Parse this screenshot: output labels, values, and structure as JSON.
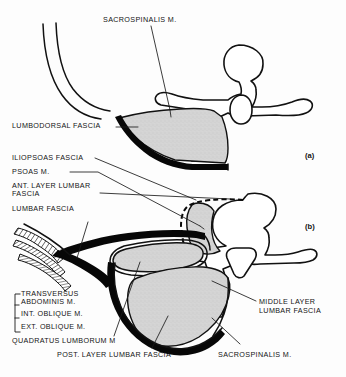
{
  "figure": {
    "panels": [
      {
        "id": "panel-a",
        "marker": "(a)"
      },
      {
        "id": "panel-b",
        "marker": "(b)"
      }
    ]
  },
  "colors": {
    "background": "#fdfdfd",
    "ink": "#111111",
    "muscle_fill": "#d2d2d2",
    "fascia_black": "#070707",
    "leader_line": "#1a1a1a",
    "text": "#141414"
  },
  "panel_a": {
    "marker": "(a)",
    "labels": {
      "sacrospinalis": "SACROSPINALIS M.",
      "lumbodorsal_fascia": "LUMBODORSAL FASCIA"
    }
  },
  "panel_b": {
    "marker": "(b)",
    "labels": {
      "iliopsoas_fascia": "ILIOPSOAS FASCIA",
      "psoas": "PSOAS M.",
      "ant_layer_lumbar_fascia_line1": "ANT. LAYER LUMBAR",
      "ant_layer_lumbar_fascia_line2": "FASCIA",
      "lumbar_fascia": "LUMBAR FASCIA",
      "transversus_abdominis_line1": "TRANSVERSUS",
      "transversus_abdominis_line2": "ABDOMINIS M.",
      "int_oblique": "INT. OBLIQUE M.",
      "ext_oblique": "EXT. OBLIQUE M.",
      "quadratus_lumborum": "QUADRATUS LUMBORUM M",
      "post_layer_lumbar_fascia": "POST. LAYER LUMBAR FASCIA",
      "middle_layer_lumbar_fascia_line1": "MIDDLE LAYER",
      "middle_layer_lumbar_fascia_line2": "LUMBAR FASCIA",
      "sacrospinalis": "SACROSPINALIS M."
    }
  }
}
